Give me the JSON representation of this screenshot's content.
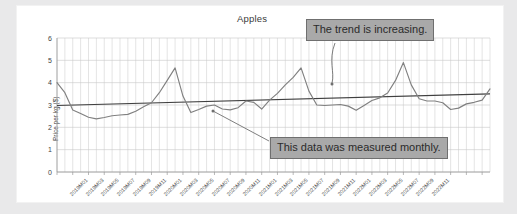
{
  "card": {
    "background": "#ffffff",
    "page_background": "#e9e9ea"
  },
  "chart_data": {
    "type": "line",
    "title": "Apples",
    "xlabel": "",
    "ylabel": "Price per kg ($)",
    "ylim": [
      0,
      6
    ],
    "yticks": [
      0,
      1,
      2,
      3,
      4,
      5,
      6
    ],
    "grid": true,
    "legend": null,
    "x": [
      "2019M01",
      "2019M02",
      "2019M03",
      "2019M04",
      "2019M05",
      "2019M06",
      "2019M07",
      "2019M08",
      "2019M09",
      "2019M10",
      "2019M11",
      "2019M12",
      "2020M01",
      "2020M02",
      "2020M03",
      "2020M04",
      "2020M05",
      "2020M06",
      "2020M07",
      "2020M08",
      "2020M09",
      "2020M10",
      "2020M11",
      "2020M12",
      "2021M01",
      "2021M02",
      "2021M03",
      "2021M04",
      "2021M05",
      "2021M06",
      "2021M07",
      "2021M08",
      "2021M09",
      "2021M10",
      "2021M11",
      "2021M12",
      "2022M01",
      "2022M02",
      "2022M03",
      "2022M04",
      "2022M05",
      "2022M06",
      "2022M07",
      "2022M08",
      "2022M09",
      "2022M10",
      "2022M11",
      "2022M12"
    ],
    "xtick_labels": [
      "2019M01",
      "2019M03",
      "2019M05",
      "2019M07",
      "2019M09",
      "2019M11",
      "2020M01",
      "2020M03",
      "2020M05",
      "2020M07",
      "2020M09",
      "2020M11",
      "2021M01",
      "2021M03",
      "2021M05",
      "2021M07",
      "2021M09",
      "2021M11",
      "2022M01",
      "2022M03",
      "2022M05",
      "2022M07",
      "2022M09",
      "2022M11"
    ],
    "series": [
      {
        "name": "Price per kg ($)",
        "color": "#808080",
        "values": [
          4.0,
          3.55,
          2.78,
          2.62,
          2.45,
          2.38,
          2.44,
          2.52,
          2.55,
          2.58,
          2.72,
          2.92,
          3.1,
          3.55,
          4.1,
          4.66,
          3.4,
          2.66,
          2.8,
          2.95,
          3.0,
          2.82,
          2.78,
          2.88,
          3.18,
          3.12,
          2.82,
          3.22,
          3.52,
          3.9,
          4.24,
          4.66,
          3.62,
          3.0,
          2.98,
          3.0,
          3.02,
          2.95,
          2.76,
          2.98,
          3.2,
          3.32,
          3.54,
          4.1,
          4.9,
          3.9,
          3.28,
          3.18
        ]
      },
      {
        "name": "trendline",
        "color": "#404040",
        "type": "linear-trend",
        "start_value": 2.98,
        "end_value": 3.5
      }
    ],
    "tail_values": [
      3.18,
      3.1,
      2.8,
      2.86,
      3.05,
      3.12,
      3.22,
      3.72
    ]
  },
  "annotations": [
    {
      "id": "callout-trend",
      "text": "The trend is increasing.",
      "fill": "#a9a9a9",
      "border": "#6f6f6f",
      "leader_to": "trendline"
    },
    {
      "id": "callout-monthly",
      "text": "This data was measured monthly.",
      "fill": "#a9a9a9",
      "border": "#6f6f6f",
      "leader_to": "data-series"
    }
  ]
}
